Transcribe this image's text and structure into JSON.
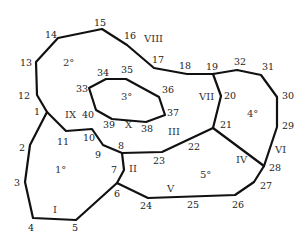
{
  "diagram": {
    "type": "planar-partition",
    "width": 308,
    "height": 240,
    "stroke_color": "#111111",
    "vertices": [
      {
        "id": "1",
        "x": 47,
        "y": 112,
        "lx": 34,
        "ly": 115
      },
      {
        "id": "2",
        "x": 30,
        "y": 145,
        "lx": 19,
        "ly": 151
      },
      {
        "id": "3",
        "x": 25,
        "y": 182,
        "lx": 14,
        "ly": 186
      },
      {
        "id": "4",
        "x": 33,
        "y": 218,
        "lx": 28,
        "ly": 231
      },
      {
        "id": "5",
        "x": 76,
        "y": 220,
        "lx": 72,
        "ly": 231
      },
      {
        "id": "6",
        "x": 117,
        "y": 183,
        "lx": 114,
        "ly": 197
      },
      {
        "id": "7",
        "x": 124,
        "y": 170,
        "lx": 111,
        "ly": 173
      },
      {
        "id": "8",
        "x": 122,
        "y": 153,
        "lx": 118,
        "ly": 149
      },
      {
        "id": "9",
        "x": 103,
        "y": 145,
        "lx": 95,
        "ly": 158
      },
      {
        "id": "10",
        "x": 92,
        "y": 129,
        "lx": 83,
        "ly": 141
      },
      {
        "id": "11",
        "x": 66,
        "y": 131,
        "lx": 57,
        "ly": 145
      },
      {
        "id": "12",
        "x": 37,
        "y": 95,
        "lx": 18,
        "ly": 99
      },
      {
        "id": "13",
        "x": 36,
        "y": 62,
        "lx": 20,
        "ly": 66
      },
      {
        "id": "14",
        "x": 58,
        "y": 38,
        "lx": 45,
        "ly": 38
      },
      {
        "id": "15",
        "x": 102,
        "y": 29,
        "lx": 94,
        "ly": 26
      },
      {
        "id": "16",
        "x": 127,
        "y": 45,
        "lx": 124,
        "ly": 39
      },
      {
        "id": "17",
        "x": 154,
        "y": 68,
        "lx": 152,
        "ly": 63
      },
      {
        "id": "18",
        "x": 187,
        "y": 74,
        "lx": 179,
        "ly": 69
      },
      {
        "id": "19",
        "x": 213,
        "y": 74,
        "lx": 206,
        "ly": 70
      },
      {
        "id": "20",
        "x": 221,
        "y": 96,
        "lx": 224,
        "ly": 99
      },
      {
        "id": "21",
        "x": 213,
        "y": 128,
        "lx": 220,
        "ly": 128
      },
      {
        "id": "22",
        "x": 0,
        "y": 0,
        "lx": 188,
        "ly": 150
      },
      {
        "id": "23",
        "x": 162,
        "y": 152,
        "lx": 153,
        "ly": 164
      },
      {
        "id": "24",
        "x": 148,
        "y": 198,
        "lx": 140,
        "ly": 209
      },
      {
        "id": "25",
        "x": 0,
        "y": 0,
        "lx": 187,
        "ly": 208
      },
      {
        "id": "26",
        "x": 235,
        "y": 195,
        "lx": 232,
        "ly": 208
      },
      {
        "id": "27",
        "x": 254,
        "y": 182,
        "lx": 260,
        "ly": 189
      },
      {
        "id": "28",
        "x": 264,
        "y": 166,
        "lx": 269,
        "ly": 171
      },
      {
        "id": "29",
        "x": 277,
        "y": 127,
        "lx": 282,
        "ly": 129
      },
      {
        "id": "30",
        "x": 277,
        "y": 97,
        "lx": 282,
        "ly": 99
      },
      {
        "id": "31",
        "x": 261,
        "y": 75,
        "lx": 262,
        "ly": 70
      },
      {
        "id": "32",
        "x": 237,
        "y": 70,
        "lx": 234,
        "ly": 65
      },
      {
        "id": "33",
        "x": 89,
        "y": 88,
        "lx": 76,
        "ly": 92
      },
      {
        "id": "34",
        "x": 106,
        "y": 79,
        "lx": 97,
        "ly": 76
      },
      {
        "id": "35",
        "x": 126,
        "y": 79,
        "lx": 121,
        "ly": 73
      },
      {
        "id": "36",
        "x": 159,
        "y": 97,
        "lx": 162,
        "ly": 93
      },
      {
        "id": "37",
        "x": 165,
        "y": 115,
        "lx": 167,
        "ly": 116
      },
      {
        "id": "38",
        "x": 146,
        "y": 122,
        "lx": 141,
        "ly": 132
      },
      {
        "id": "39",
        "x": 0,
        "y": 0,
        "lx": 103,
        "ly": 128
      },
      {
        "id": "40",
        "x": 96,
        "y": 110,
        "lx": 82,
        "ly": 118
      }
    ],
    "outer_boundary": "47,112 30,145 25,182 33,218 76,220 117,183 148,198 235,195 254,182 264,166 277,127 277,97 261,75 237,70 213,74 187,74 154,68 127,45 102,29 58,38 36,62 37,95 47,112",
    "inner_polygon": "89,88 106,79 126,79 159,97 165,115 146,122 112,119 96,110 89,88",
    "edges": [
      "47,112 66,131 92,129 103,145 122,153 124,170 117,183",
      "122,153 162,152 213,128",
      "213,74 221,96 213,128",
      "213,128 264,166"
    ],
    "region_labels": [
      {
        "id": "I",
        "x": 53,
        "y": 213
      },
      {
        "id": "II",
        "x": 129,
        "y": 172
      },
      {
        "id": "III",
        "x": 168,
        "y": 135
      },
      {
        "id": "IV",
        "x": 236,
        "y": 163
      },
      {
        "id": "V",
        "x": 167,
        "y": 192
      },
      {
        "id": "VI",
        "x": 275,
        "y": 153
      },
      {
        "id": "VII",
        "x": 199,
        "y": 100
      },
      {
        "id": "VIII",
        "x": 144,
        "y": 42
      },
      {
        "id": "IX",
        "x": 65,
        "y": 118
      },
      {
        "id": "X",
        "x": 125,
        "y": 128
      }
    ],
    "face_labels": [
      {
        "id": "1°",
        "x": 55,
        "y": 173
      },
      {
        "id": "2°",
        "x": 63,
        "y": 66
      },
      {
        "id": "3°",
        "x": 121,
        "y": 100
      },
      {
        "id": "4°",
        "x": 247,
        "y": 117
      },
      {
        "id": "5°",
        "x": 200,
        "y": 178
      }
    ]
  }
}
